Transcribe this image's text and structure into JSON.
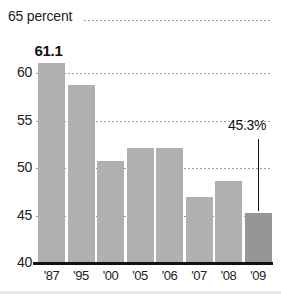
{
  "chart_data": {
    "type": "bar",
    "title": "",
    "xlabel": "",
    "ylabel": "",
    "top_axis_label": "65 percent",
    "categories": [
      "'87",
      "'95",
      "'00",
      "'05",
      "'06",
      "'07",
      "'08",
      "'09"
    ],
    "values": [
      61.1,
      58.8,
      50.8,
      52.1,
      52.1,
      47.0,
      48.6,
      45.3
    ],
    "ylim": [
      40,
      65
    ],
    "yticks": [
      40,
      45,
      50,
      55,
      60
    ],
    "ytick_labels": [
      "40",
      "45",
      "50",
      "55",
      "60"
    ],
    "grid": true,
    "grid_style": "dotted-horizontal",
    "legend": "none",
    "annotations": [
      {
        "label": "61.1",
        "category": "'87",
        "value": 61.1,
        "style": "bold-above-bar"
      },
      {
        "label": "45.3%",
        "category": "'09",
        "value": 45.3,
        "style": "callout-with-leader-line"
      }
    ],
    "colors": {
      "bar": "#b0b0b0",
      "bar_highlight": "#969696",
      "gridline": "#9a9a9a",
      "baseline": "#111111",
      "text": "#222222"
    },
    "highlight_index": 7
  }
}
